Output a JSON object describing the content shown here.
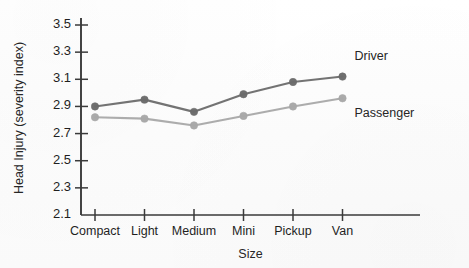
{
  "chart_data": {
    "type": "line",
    "title": "",
    "subtitle": "",
    "xlabel": "Size",
    "ylabel": "Head Injury (severity index)",
    "categories": [
      "Compact",
      "Light",
      "Medium",
      "Mini",
      "Pickup",
      "Van"
    ],
    "ylim": [
      2.1,
      3.5
    ],
    "ytick_labels": [
      "3.5",
      "3.3",
      "3.1",
      "2.9",
      "2.7",
      "2.5",
      "2.3",
      "2.1"
    ],
    "ytick_values": [
      3.5,
      3.3,
      3.1,
      2.9,
      2.7,
      2.5,
      2.3,
      2.1
    ],
    "grid": false,
    "legend_position": "inline-right",
    "series": [
      {
        "name": "Driver",
        "color": "#6b6b6b",
        "marker": "circle",
        "values": [
          2.9,
          2.95,
          2.86,
          2.99,
          3.08,
          3.12
        ]
      },
      {
        "name": "Passenger",
        "color": "#a8a8a8",
        "marker": "circle",
        "values": [
          2.82,
          2.81,
          2.76,
          2.83,
          2.9,
          2.96
        ]
      }
    ],
    "annotations": [
      {
        "text": "Driver",
        "series": "Driver"
      },
      {
        "text": "Passenger",
        "series": "Passenger"
      }
    ]
  },
  "axis": {
    "line_color": "#3a3a3a"
  }
}
